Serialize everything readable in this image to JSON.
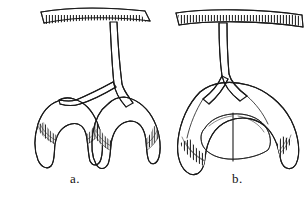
{
  "figure": {
    "kind": "scientific-line-drawing",
    "background_color": "#ffffff",
    "ink_color": "#1a1a1a",
    "panel_count": 2,
    "panels": [
      {
        "id": "a",
        "label": "a.",
        "description": "Paired separate arched hooks suspended from a hatched horizontal bar by a single vertical stem",
        "shading": "stipple-dots",
        "inner_margin": "comb-hatched ladder band",
        "arch_count": 2,
        "fused": "no"
      },
      {
        "id": "b",
        "label": "b.",
        "description": "Single broad fused arch suspended from a hatched horizontal bar by a single vertical stem, with two inner lobes",
        "shading": "dash-stipple",
        "inner_margin": "comb-hatched ladder band",
        "arch_count": 1,
        "fused": "yes"
      }
    ]
  },
  "labels": {
    "a": "a.",
    "b": "b."
  }
}
